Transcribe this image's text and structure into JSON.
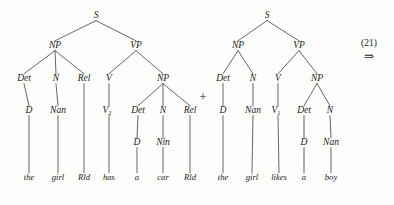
{
  "figure": {
    "background_color": "#fdfdfc",
    "ink_color": "#1a1a1a",
    "edge_color": "#4a4a4a",
    "equation_number": "(21)",
    "derivation_arrow": "⇒",
    "combine_operator": "+"
  },
  "trees": [
    {
      "id": "left-tree",
      "sentence": "the girl Rld has a car Rld",
      "root": "S",
      "nodes": [
        {
          "id": "L-S",
          "label": "S",
          "x": 96,
          "y": 18,
          "level": 0
        },
        {
          "id": "L-NP",
          "label": "NP",
          "x": 55,
          "y": 48,
          "level": 1
        },
        {
          "id": "L-VP",
          "label": "VP",
          "x": 136,
          "y": 48,
          "level": 1
        },
        {
          "id": "L-Det1",
          "label": "Det",
          "x": 24,
          "y": 81,
          "level": 2
        },
        {
          "id": "L-N1",
          "label": "N",
          "x": 56,
          "y": 81,
          "level": 2
        },
        {
          "id": "L-Rel1",
          "label": "Rel",
          "x": 84,
          "y": 81,
          "level": 2
        },
        {
          "id": "L-V",
          "label": "V",
          "x": 109,
          "y": 81,
          "level": 2
        },
        {
          "id": "L-NP2",
          "label": "NP",
          "x": 163,
          "y": 81,
          "level": 2
        },
        {
          "id": "L-D1",
          "label": "D",
          "x": 29,
          "y": 113,
          "level": 3
        },
        {
          "id": "L-Nan1",
          "label": "Nan",
          "x": 58,
          "y": 113,
          "level": 3
        },
        {
          "id": "L-V2",
          "label": "V",
          "sub": "2",
          "x": 109,
          "y": 113,
          "level": 3
        },
        {
          "id": "L-Det2",
          "label": "Det",
          "x": 138,
          "y": 113,
          "level": 3
        },
        {
          "id": "L-N2",
          "label": "N",
          "x": 163,
          "y": 113,
          "level": 3
        },
        {
          "id": "L-Rel2",
          "label": "Rel",
          "x": 190,
          "y": 113,
          "level": 3
        },
        {
          "id": "L-D2",
          "label": "D",
          "x": 137,
          "y": 145,
          "level": 4
        },
        {
          "id": "L-Nin",
          "label": "Nin",
          "x": 163,
          "y": 145,
          "level": 4
        }
      ],
      "terminals": [
        {
          "id": "L-t-the",
          "label": "the",
          "x": 29,
          "y": 180,
          "parent": "L-D1"
        },
        {
          "id": "L-t-girl",
          "label": "girl",
          "x": 58,
          "y": 180,
          "parent": "L-Nan1"
        },
        {
          "id": "L-t-rld1",
          "label": "Rld",
          "x": 84,
          "y": 180,
          "parent": "L-Rel1"
        },
        {
          "id": "L-t-has",
          "label": "has",
          "x": 109,
          "y": 180,
          "parent": "L-V2"
        },
        {
          "id": "L-t-a",
          "label": "a",
          "x": 137,
          "y": 180,
          "parent": "L-D2"
        },
        {
          "id": "L-t-car",
          "label": "car",
          "x": 163,
          "y": 180,
          "parent": "L-Nin"
        },
        {
          "id": "L-t-rld2",
          "label": "Rld",
          "x": 190,
          "y": 180,
          "parent": "L-Rel2"
        }
      ],
      "edges": [
        [
          "L-S",
          "L-NP"
        ],
        [
          "L-S",
          "L-VP"
        ],
        [
          "L-NP",
          "L-Det1"
        ],
        [
          "L-NP",
          "L-N1"
        ],
        [
          "L-NP",
          "L-Rel1"
        ],
        [
          "L-VP",
          "L-V"
        ],
        [
          "L-VP",
          "L-NP2"
        ],
        [
          "L-Det1",
          "L-D1"
        ],
        [
          "L-N1",
          "L-Nan1"
        ],
        [
          "L-V",
          "L-V2"
        ],
        [
          "L-NP2",
          "L-Det2"
        ],
        [
          "L-NP2",
          "L-N2"
        ],
        [
          "L-NP2",
          "L-Rel2"
        ],
        [
          "L-Det2",
          "L-D2"
        ],
        [
          "L-N2",
          "L-Nin"
        ],
        [
          "L-D1",
          "L-t-the"
        ],
        [
          "L-Nan1",
          "L-t-girl"
        ],
        [
          "L-Rel1",
          "L-t-rld1"
        ],
        [
          "L-V2",
          "L-t-has"
        ],
        [
          "L-D2",
          "L-t-a"
        ],
        [
          "L-Nin",
          "L-t-car"
        ],
        [
          "L-Rel2",
          "L-t-rld2"
        ]
      ]
    },
    {
      "id": "right-tree",
      "sentence": "the girl likes a boy",
      "root": "S",
      "nodes": [
        {
          "id": "R-S",
          "label": "S",
          "x": 267,
          "y": 18,
          "level": 0
        },
        {
          "id": "R-NP",
          "label": "NP",
          "x": 238,
          "y": 48,
          "level": 1
        },
        {
          "id": "R-VP",
          "label": "VP",
          "x": 299,
          "y": 48,
          "level": 1
        },
        {
          "id": "R-Det1",
          "label": "Det",
          "x": 223,
          "y": 81,
          "level": 2
        },
        {
          "id": "R-N1",
          "label": "N",
          "x": 253,
          "y": 81,
          "level": 2
        },
        {
          "id": "R-V",
          "label": "V",
          "x": 278,
          "y": 81,
          "level": 2
        },
        {
          "id": "R-NP2",
          "label": "NP",
          "x": 317,
          "y": 81,
          "level": 2
        },
        {
          "id": "R-D1",
          "label": "D",
          "x": 223,
          "y": 113,
          "level": 3
        },
        {
          "id": "R-Nan1",
          "label": "Nan",
          "x": 253,
          "y": 113,
          "level": 3
        },
        {
          "id": "R-V1",
          "label": "V",
          "sub": "1",
          "x": 278,
          "y": 113,
          "level": 3
        },
        {
          "id": "R-Det2",
          "label": "Det",
          "x": 304,
          "y": 113,
          "level": 3
        },
        {
          "id": "R-N2",
          "label": "N",
          "x": 330,
          "y": 113,
          "level": 3
        },
        {
          "id": "R-D2",
          "label": "D",
          "x": 304,
          "y": 145,
          "level": 4
        },
        {
          "id": "R-Nan2",
          "label": "Nan",
          "x": 331,
          "y": 145,
          "level": 4
        }
      ],
      "terminals": [
        {
          "id": "R-t-the",
          "label": "the",
          "x": 223,
          "y": 180,
          "parent": "R-D1"
        },
        {
          "id": "R-t-girl",
          "label": "girl",
          "x": 252,
          "y": 180,
          "parent": "R-Nan1"
        },
        {
          "id": "R-t-likes",
          "label": "likes",
          "x": 279,
          "y": 180,
          "parent": "R-V1"
        },
        {
          "id": "R-t-a",
          "label": "a",
          "x": 304,
          "y": 180,
          "parent": "R-D2"
        },
        {
          "id": "R-t-boy",
          "label": "boy",
          "x": 331,
          "y": 180,
          "parent": "R-Nan2"
        }
      ],
      "edges": [
        [
          "R-S",
          "R-NP"
        ],
        [
          "R-S",
          "R-VP"
        ],
        [
          "R-NP",
          "R-Det1"
        ],
        [
          "R-NP",
          "R-N1"
        ],
        [
          "R-VP",
          "R-V"
        ],
        [
          "R-VP",
          "R-NP2"
        ],
        [
          "R-Det1",
          "R-D1"
        ],
        [
          "R-N1",
          "R-Nan1"
        ],
        [
          "R-V",
          "R-V1"
        ],
        [
          "R-NP2",
          "R-Det2"
        ],
        [
          "R-NP2",
          "R-N2"
        ],
        [
          "R-Det2",
          "R-D2"
        ],
        [
          "R-N2",
          "R-Nan2"
        ],
        [
          "R-D1",
          "R-t-the"
        ],
        [
          "R-Nan1",
          "R-t-girl"
        ],
        [
          "R-V1",
          "R-t-likes"
        ],
        [
          "R-D2",
          "R-t-a"
        ],
        [
          "R-Nan2",
          "R-t-boy"
        ]
      ]
    }
  ],
  "operator": {
    "symbol": "+",
    "x": 203,
    "y": 101
  },
  "annotation": {
    "number": "(21)",
    "number_x": 369,
    "number_y": 46,
    "arrow": "⇒",
    "arrow_x": 369,
    "arrow_y": 60
  }
}
